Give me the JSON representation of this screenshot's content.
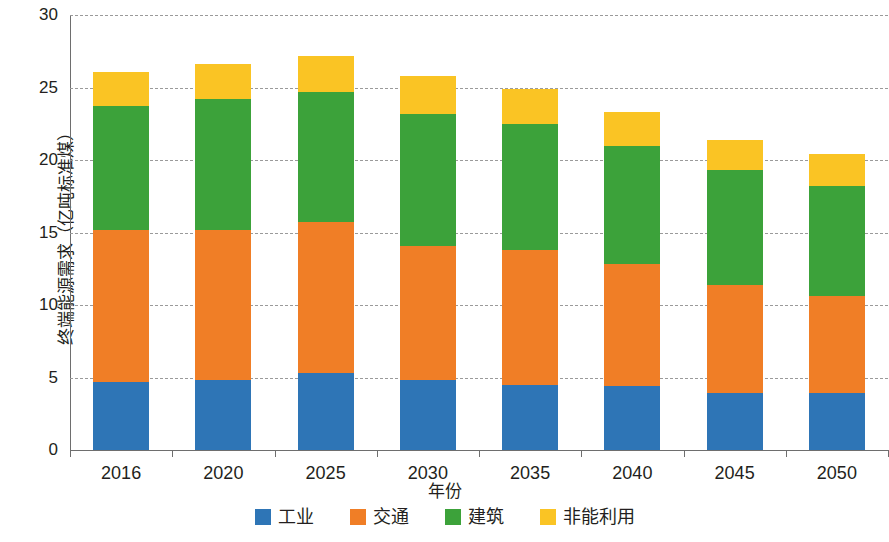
{
  "chart_data": {
    "type": "bar",
    "stacked": true,
    "title": "",
    "xlabel": "年份",
    "ylabel": "终端能源需求（亿吨标准煤）",
    "categories": [
      "2016",
      "2020",
      "2025",
      "2030",
      "2035",
      "2040",
      "2045",
      "2050"
    ],
    "ylim": [
      0,
      30
    ],
    "yticks": [
      0,
      5,
      10,
      15,
      20,
      25,
      30
    ],
    "grid": true,
    "legend_position": "bottom",
    "series": [
      {
        "name": "工业",
        "color": "#2E75B6",
        "values": [
          4.7,
          4.8,
          5.3,
          4.8,
          4.5,
          4.4,
          3.9,
          3.9
        ]
      },
      {
        "name": "交通",
        "color": "#F07E26",
        "values": [
          10.5,
          10.4,
          10.4,
          9.3,
          9.3,
          8.4,
          7.5,
          6.7
        ]
      },
      {
        "name": "建筑",
        "color": "#3CA23A",
        "values": [
          8.5,
          9.0,
          9.0,
          9.1,
          8.7,
          8.2,
          7.9,
          7.6
        ]
      },
      {
        "name": "非能利用",
        "color": "#FAC424",
        "values": [
          2.4,
          2.4,
          2.5,
          2.6,
          2.4,
          2.3,
          2.1,
          2.2
        ]
      }
    ],
    "totals": [
      26.1,
      26.6,
      27.2,
      25.8,
      24.9,
      23.3,
      21.4,
      20.4
    ],
    "axis_color": "#6e6e6e",
    "grid_color": "#9a9a9a"
  }
}
